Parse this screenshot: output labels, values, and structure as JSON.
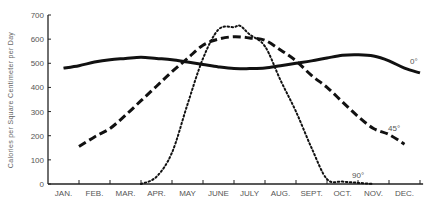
{
  "chart_data": {
    "type": "line",
    "title": "",
    "xlabel": "",
    "ylabel": "Calories per Square Centimeter per Day",
    "ylim": [
      0,
      700
    ],
    "yticks": [
      0,
      100,
      200,
      300,
      400,
      500,
      600,
      700
    ],
    "categories": [
      "JAN.",
      "FEB.",
      "MAR.",
      "APR.",
      "MAY",
      "JUNE",
      "JULY",
      "AUG.",
      "SEPT.",
      "OCT.",
      "NOV.",
      "DEC."
    ],
    "grid": false,
    "legend": "inline labels at line ends",
    "series": [
      {
        "name": "0°",
        "style": "solid",
        "x": [
          0.5,
          1,
          1.5,
          2,
          2.5,
          3,
          3.5,
          4,
          4.5,
          5,
          5.5,
          6,
          6.5,
          7,
          7.5,
          8,
          8.5,
          9,
          9.5,
          10,
          10.5,
          11,
          11.5,
          12
        ],
        "values": [
          480,
          490,
          505,
          515,
          520,
          525,
          520,
          515,
          505,
          495,
          485,
          478,
          478,
          480,
          490,
          500,
          510,
          522,
          533,
          535,
          530,
          510,
          480,
          460
        ]
      },
      {
        "name": "45°",
        "style": "dashed",
        "x": [
          1,
          1.5,
          2,
          2.5,
          3,
          3.5,
          4,
          4.5,
          5,
          5.5,
          6,
          6.5,
          7,
          7.5,
          8,
          8.5,
          9,
          9.5,
          10,
          10.5,
          11,
          11.5
        ],
        "values": [
          155,
          195,
          230,
          285,
          345,
          405,
          465,
          520,
          575,
          600,
          610,
          605,
          595,
          555,
          510,
          450,
          400,
          340,
          280,
          230,
          205,
          165
        ]
      },
      {
        "name": "90°",
        "style": "dotted",
        "x": [
          3,
          3.5,
          4,
          4.5,
          5,
          5.5,
          6,
          6.2,
          6.5,
          7,
          7.5,
          8,
          8.5,
          9,
          9.5,
          10,
          10.5
        ],
        "values": [
          0,
          30,
          130,
          330,
          520,
          640,
          650,
          655,
          620,
          570,
          430,
          300,
          150,
          20,
          10,
          5,
          0
        ]
      }
    ]
  },
  "labels": {
    "y_axis_title": "Calories per Square Centimeter per Day",
    "series_0": "0°",
    "series_45": "45°",
    "series_90": "90°"
  }
}
